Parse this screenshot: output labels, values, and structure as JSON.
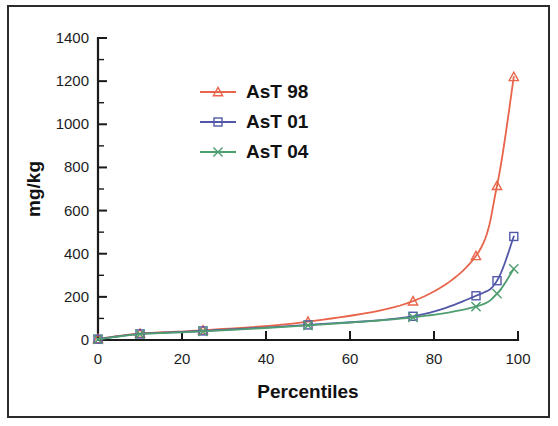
{
  "figure": {
    "frame_color": "#2b2b2b",
    "background": "#ffffff"
  },
  "chart_data": {
    "type": "line",
    "title": "",
    "xlabel": "Percentiles",
    "ylabel": "mg/kg",
    "xlim": [
      0,
      100
    ],
    "ylim": [
      0,
      1400
    ],
    "xticks": [
      0,
      20,
      40,
      60,
      80,
      100
    ],
    "yticks": [
      0,
      200,
      400,
      600,
      800,
      1000,
      1200,
      1400
    ],
    "xtick_labels": [
      "0",
      "20",
      "40",
      "60",
      "80",
      "100"
    ],
    "ytick_labels": [
      "0",
      "200",
      "400",
      "600",
      "800",
      "1000",
      "1200",
      "1400"
    ],
    "minor_ticks": true,
    "grid": false,
    "legend_position": "upper-left-inside",
    "x": [
      0,
      10,
      25,
      50,
      75,
      90,
      95,
      99
    ],
    "series": [
      {
        "name": "AsT 98",
        "color": "#e8644a",
        "marker": "triangle",
        "values": [
          5,
          30,
          45,
          85,
          180,
          390,
          715,
          1220
        ]
      },
      {
        "name": "AsT 01",
        "color": "#5158a8",
        "marker": "square",
        "values": [
          4,
          28,
          42,
          70,
          110,
          205,
          275,
          480
        ]
      },
      {
        "name": "AsT 04",
        "color": "#4f9e70",
        "marker": "x",
        "values": [
          3,
          27,
          40,
          68,
          105,
          155,
          215,
          330
        ]
      }
    ]
  },
  "legend": {
    "entries": [
      {
        "label": "AsT 98",
        "color": "#e8644a",
        "marker": "triangle"
      },
      {
        "label": "AsT 01",
        "color": "#5158a8",
        "marker": "square"
      },
      {
        "label": "AsT 04",
        "color": "#4f9e70",
        "marker": "x"
      }
    ]
  },
  "axes": {
    "x_title": "Percentiles",
    "y_title": "mg/kg"
  }
}
